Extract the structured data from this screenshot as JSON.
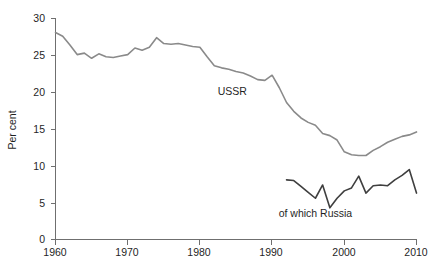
{
  "chart_data": {
    "type": "line",
    "title": "",
    "subtitle": "",
    "xlabel": "",
    "ylabel": "Per cent",
    "xlim": [
      1960,
      2010
    ],
    "ylim": [
      0,
      30
    ],
    "grid": false,
    "legend_position": "inline-annotation",
    "xticks": [
      1960,
      1970,
      1980,
      1990,
      2000,
      2010
    ],
    "xtick_labels": [
      "1960",
      "1970",
      "1980",
      "1990",
      "2000",
      "2010"
    ],
    "yticks": [
      0,
      5,
      10,
      15,
      20,
      25,
      30
    ],
    "ytick_labels": [
      "0",
      "5",
      "10",
      "15",
      "20",
      "25",
      "30"
    ],
    "annotations": [
      {
        "text": "USSR",
        "x": 1984.5,
        "y": 19.6
      },
      {
        "text": "of which Russia",
        "x": 1996.0,
        "y": 3.1
      }
    ],
    "series": [
      {
        "name": "USSR",
        "label": "USSR",
        "color": "#8a8a8a",
        "x": [
          1960,
          1961,
          1962,
          1963,
          1964,
          1965,
          1966,
          1967,
          1968,
          1969,
          1970,
          1971,
          1972,
          1973,
          1974,
          1975,
          1976,
          1977,
          1978,
          1979,
          1980,
          1981,
          1982,
          1983,
          1984,
          1985,
          1986,
          1987,
          1988,
          1989,
          1990,
          1991,
          1992,
          1993,
          1994,
          1995,
          1996,
          1997,
          1998,
          1999,
          2000,
          2001,
          2002,
          2003,
          2004,
          2005,
          2006,
          2007,
          2008,
          2009,
          2010
        ],
        "values": [
          28.1,
          27.6,
          26.4,
          25.1,
          25.3,
          24.6,
          25.2,
          24.8,
          24.7,
          24.9,
          25.1,
          26.0,
          25.7,
          26.1,
          27.4,
          26.6,
          26.5,
          26.6,
          26.4,
          26.2,
          26.1,
          24.8,
          23.6,
          23.3,
          23.1,
          22.8,
          22.6,
          22.2,
          21.7,
          21.6,
          22.3,
          20.6,
          18.6,
          17.4,
          16.5,
          15.9,
          15.5,
          14.4,
          14.1,
          13.5,
          11.9,
          11.5,
          11.4,
          11.4,
          12.1,
          12.6,
          13.2,
          13.6,
          14.0,
          14.2,
          14.6
        ]
      },
      {
        "name": "of which Russia",
        "label": "of which Russia",
        "color": "#3f3f3f",
        "x": [
          1992,
          1993,
          1994,
          1995,
          1996,
          1997,
          1998,
          1999,
          2000,
          2001,
          2002,
          2003,
          2004,
          2005,
          2006,
          2007,
          2008,
          2009,
          2010
        ],
        "values": [
          8.1,
          8.0,
          7.2,
          6.4,
          5.6,
          7.4,
          4.3,
          5.6,
          6.6,
          7.0,
          8.6,
          6.3,
          7.3,
          7.4,
          7.3,
          8.1,
          8.7,
          9.5,
          6.3
        ]
      }
    ]
  },
  "axis": {
    "y_title": "Per cent"
  }
}
